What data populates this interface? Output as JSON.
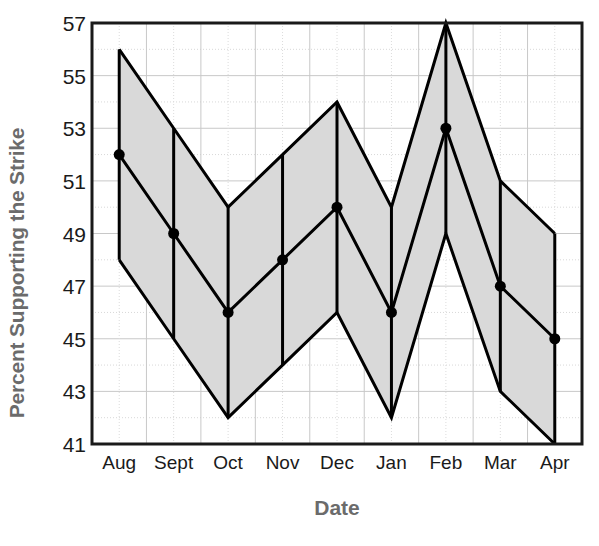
{
  "chart_data": {
    "type": "line",
    "title": "",
    "xlabel": "Date",
    "ylabel": "Percent Supporting the Strike",
    "categories": [
      "Aug",
      "Sept",
      "Oct",
      "Nov",
      "Dec",
      "Jan",
      "Feb",
      "Mar",
      "Apr"
    ],
    "ylim": [
      41,
      57
    ],
    "yticks": [
      41,
      43,
      45,
      47,
      49,
      51,
      53,
      55,
      57
    ],
    "ytick_labels": [
      "41",
      "43",
      "45",
      "47",
      "49",
      "51",
      "53",
      "55",
      "57"
    ],
    "grid": true,
    "legend": "none",
    "band_fill": "#d9d9d9",
    "line_color": "#000000",
    "marker": "circle",
    "series": [
      {
        "name": "Percent Supporting the Strike",
        "values": [
          52,
          49,
          46,
          48,
          50,
          46,
          53,
          47,
          45
        ],
        "upper": [
          56,
          53,
          50,
          52,
          54,
          50,
          57,
          51,
          49
        ],
        "lower": [
          48,
          45,
          42,
          44,
          46,
          42,
          49,
          43,
          41
        ]
      }
    ]
  },
  "axis": {
    "x_title": "Date",
    "y_title": "Percent Supporting the Strike"
  }
}
